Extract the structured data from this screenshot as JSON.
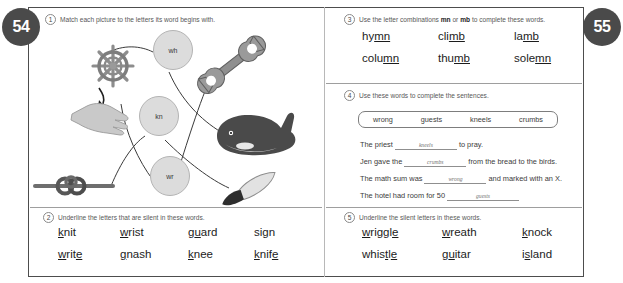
{
  "page": {
    "left_page_number": "54",
    "right_page_number": "55"
  },
  "exercise1": {
    "number": "1",
    "instruction": "Match each picture to the letters its word begins with.",
    "letter_circles": [
      {
        "label": "wh"
      },
      {
        "label": "kn"
      },
      {
        "label": "wr"
      }
    ],
    "pictures": [
      {
        "name": "ships-wheel-picture",
        "answer": "wh"
      },
      {
        "name": "hand-wrist-picture",
        "answer": "wr"
      },
      {
        "name": "knot-picture",
        "answer": "kn"
      },
      {
        "name": "wrench-picture",
        "answer": "wr"
      },
      {
        "name": "whale-picture",
        "answer": "wh"
      },
      {
        "name": "knife-picture",
        "answer": "kn"
      }
    ]
  },
  "exercise2": {
    "number": "2",
    "instruction": "Underline the letters that are silent in these words.",
    "rows": [
      [
        {
          "pre": "",
          "silent": "k",
          "post": "nit"
        },
        {
          "pre": "",
          "silent": "w",
          "post": "rist"
        },
        {
          "pre": "g",
          "silent": "u",
          "post": "ard"
        },
        {
          "pre": "sign",
          "silent": "",
          "post": ""
        }
      ],
      [
        {
          "pre": "",
          "silent": "w",
          "post": "rit",
          "silent2": "e"
        },
        {
          "pre": "",
          "silent": "g",
          "post": "nash"
        },
        {
          "pre": "",
          "silent": "k",
          "post": "nee"
        },
        {
          "pre": "",
          "silent": "k",
          "post": "nif",
          "silent2": "e"
        }
      ]
    ],
    "words_plain": [
      "knit",
      "wrist",
      "guard",
      "sign",
      "write",
      "gnash",
      "knee",
      "knife"
    ]
  },
  "exercise3": {
    "number": "3",
    "instruction_pre": "Use the letter combinations ",
    "combo_a": "mn",
    "instruction_mid": " or ",
    "combo_b": "mb",
    "instruction_post": " to complete these words.",
    "rows": [
      [
        {
          "stem": "hy",
          "fill": "mn"
        },
        {
          "stem": "cli",
          "fill": "mb"
        },
        {
          "stem": "la",
          "fill": "mb"
        }
      ],
      [
        {
          "stem": "colu",
          "fill": "mn"
        },
        {
          "stem": "thu",
          "fill": "mb"
        },
        {
          "stem": "sole",
          "fill": "mn"
        }
      ]
    ]
  },
  "exercise4": {
    "number": "4",
    "instruction": "Use these words to complete the sentences.",
    "word_bank": [
      "wrong",
      "guests",
      "kneels",
      "crumbs"
    ],
    "sentences": [
      {
        "before": "The priest",
        "answer": "kneels",
        "after": "to pray."
      },
      {
        "before": "Jen gave the",
        "answer": "crumbs",
        "after": "from the bread to the birds."
      },
      {
        "before": "The math sum was",
        "answer": "wrong",
        "after": "and marked with an X."
      },
      {
        "before": "The hotel had room for 50",
        "answer": "guests",
        "after": ""
      }
    ]
  },
  "exercise5": {
    "number": "5",
    "instruction": "Underline the silent letters in these words.",
    "rows": [
      [
        {
          "pre": "",
          "silent": "w",
          "post": "riggl",
          "silent2": "e"
        },
        {
          "pre": "",
          "silent": "w",
          "post": "reath"
        },
        {
          "pre": "",
          "silent": "k",
          "post": "nock"
        }
      ],
      [
        {
          "pre": "whis",
          "silent": "t",
          "post": "l",
          "silent2": "e"
        },
        {
          "pre": "g",
          "silent": "u",
          "post": "itar"
        },
        {
          "pre": "i",
          "silent": "s",
          "post": "land"
        }
      ]
    ],
    "words_plain": [
      "wriggle",
      "wreath",
      "knock",
      "whistle",
      "guitar",
      "island"
    ]
  }
}
